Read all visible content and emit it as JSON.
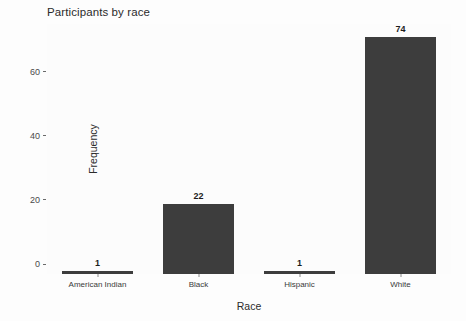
{
  "chart_data": {
    "type": "bar",
    "title": "Participants by race",
    "xlabel": "Race",
    "ylabel": "Frequency",
    "categories": [
      "American Indian",
      "Black",
      "Hispanic",
      "White"
    ],
    "values": [
      1,
      22,
      1,
      74
    ],
    "value_labels": [
      "1",
      "22",
      "1",
      "74"
    ],
    "ylim": [
      0,
      78
    ],
    "yticks": [
      0,
      20,
      40,
      60
    ],
    "ytick_labels": [
      "0",
      "20",
      "40",
      "60"
    ],
    "grid": false,
    "legend": "none",
    "bar_color": "#3d3d3d",
    "panel_background": "#fcfcfc",
    "axis_text_color": "#3a3a3a"
  }
}
